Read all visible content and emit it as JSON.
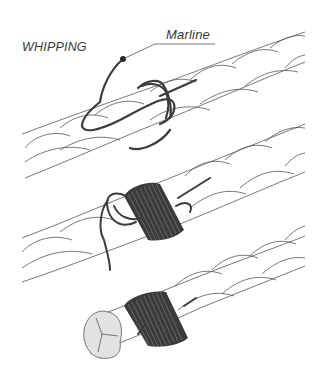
{
  "diagram": {
    "title": "WHIPPING",
    "labels": {
      "marline": "Marline"
    },
    "steps": [
      {
        "id": 1,
        "description": "Loop of marline laid along rope with first turns"
      },
      {
        "id": 2,
        "description": "Turns of marline wound tightly over the loop"
      },
      {
        "id": 3,
        "description": "Finished whipping near cut rope end showing three strands"
      }
    ],
    "colors": {
      "rope_stroke": "#4a4a4a",
      "marline": "#3c3c3c",
      "rope_end_fill": "#e2e2e2",
      "background": "#ffffff"
    }
  }
}
